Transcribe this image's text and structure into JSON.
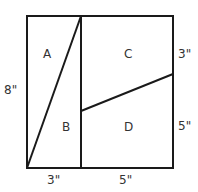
{
  "diagram": {
    "regions": {
      "a": "A",
      "b": "B",
      "c": "C",
      "d": "D"
    },
    "dimensions": {
      "left_height": "8\"",
      "right_top": "3\"",
      "right_bottom": "5\"",
      "bottom_left": "3\"",
      "bottom_right": "5\""
    },
    "colors": {
      "line": "#1a1a1a",
      "text": "#333333",
      "background": "#ffffff"
    }
  }
}
